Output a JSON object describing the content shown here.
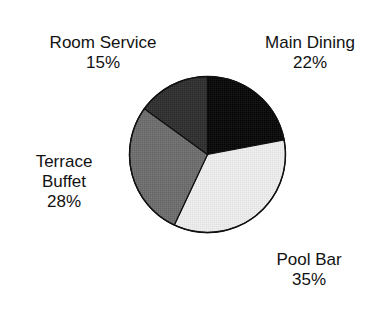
{
  "chart_data": {
    "type": "pie",
    "title": "",
    "subtitle": "",
    "xlabel": "",
    "ylabel": "",
    "legend_position": "none",
    "grid": false,
    "unit": "%",
    "start_angle_deg": 0,
    "direction": "clockwise",
    "categories": [
      "Main Dining",
      "Pool Bar",
      "Terrace Buffet",
      "Room Service"
    ],
    "values": [
      22,
      35,
      28,
      15
    ],
    "total": 100,
    "slices": [
      {
        "label": "Main Dining",
        "value": 22,
        "value_text": "22%",
        "color": "#0d0d0d",
        "start_deg": 0,
        "end_deg": 79.2,
        "label_position": "top-right"
      },
      {
        "label": "Pool Bar",
        "value": 35,
        "value_text": "35%",
        "color": "#e8e8e8",
        "start_deg": 79.2,
        "end_deg": 205.2,
        "label_position": "bottom-right"
      },
      {
        "label": "Terrace Buffet",
        "value": 28,
        "value_text": "28%",
        "color": "#6e6e6e",
        "start_deg": 205.2,
        "end_deg": 306.0,
        "label_position": "left"
      },
      {
        "label": "Room Service",
        "value": 15,
        "value_text": "15%",
        "color": "#333333",
        "start_deg": 306.0,
        "end_deg": 360.0,
        "label_position": "top-left"
      }
    ]
  },
  "labels": {
    "room_service": {
      "name": "Room Service",
      "value_text": "15%"
    },
    "main_dining": {
      "name": "Main Dining",
      "value_text": "22%"
    },
    "terrace_buffet": {
      "name_line1": "Terrace",
      "name_line2": "Buffet",
      "value_text": "28%"
    },
    "pool_bar": {
      "name": "Pool Bar",
      "value_text": "35%"
    }
  },
  "colors": {
    "background": "#ffffff",
    "text": "#121212",
    "outline": "#101010"
  }
}
